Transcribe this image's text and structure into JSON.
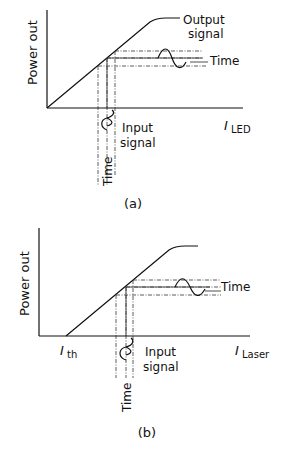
{
  "panels": [
    {
      "id": "a",
      "caption": "(a)",
      "y_axis_label": "Power out",
      "x_axis_label_italic": "I",
      "x_axis_label_sub": "LED",
      "output_label_line1": "Output",
      "output_label_line2": "signal",
      "output_time_label": "Time",
      "input_label_line1": "Input",
      "input_label_line2": "signal",
      "input_time_label": "Time"
    },
    {
      "id": "b",
      "caption": "(b)",
      "y_axis_label": "Power out",
      "x_axis_label_italic": "I",
      "x_axis_label_sub": "Laser",
      "threshold_label_italic": "I",
      "threshold_label_sub": "th",
      "output_time_label": "Time",
      "input_label_line1": "Input",
      "input_label_line2": "signal",
      "input_time_label": "Time"
    }
  ]
}
